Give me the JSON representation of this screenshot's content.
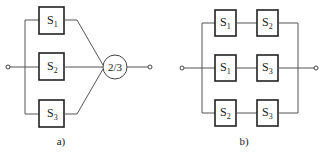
{
  "diagrams": [
    {
      "caption": "a)",
      "type": "2-out-of-3 voting system",
      "blocks": [
        {
          "name": "S",
          "sub": "1"
        },
        {
          "name": "S",
          "sub": "2"
        },
        {
          "name": "S",
          "sub": "3"
        }
      ],
      "voter": "2/3"
    },
    {
      "caption": "b)",
      "type": "parallel of series pairs",
      "rows": [
        [
          {
            "name": "S",
            "sub": "1"
          },
          {
            "name": "S",
            "sub": "2"
          }
        ],
        [
          {
            "name": "S",
            "sub": "1"
          },
          {
            "name": "S",
            "sub": "3"
          }
        ],
        [
          {
            "name": "S",
            "sub": "2"
          },
          {
            "name": "S",
            "sub": "3"
          }
        ]
      ]
    }
  ]
}
